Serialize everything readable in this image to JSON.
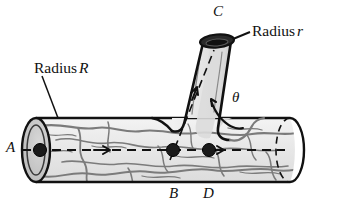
{
  "figure": {
    "background_color": "#ffffff",
    "outline_color": "#111111",
    "fill_color": "#ededed",
    "vein_color": "#7a7a7a",
    "dark_fill_color": "#2b2b2b",
    "labels": {
      "radius_main_word": "Radius",
      "radius_main_symbol": "R",
      "radius_branch_word": "Radius",
      "radius_branch_symbol": "r",
      "point_a": "A",
      "point_b": "B",
      "point_c": "C",
      "point_d": "D",
      "angle": "θ"
    },
    "annotations": {
      "flow_arrow_count": 3,
      "marked_points": [
        "A",
        "B",
        "C",
        "D"
      ],
      "angle_symbol": "θ",
      "leader_lines": [
        "radius-R-leader",
        "radius-r-leader"
      ]
    }
  }
}
